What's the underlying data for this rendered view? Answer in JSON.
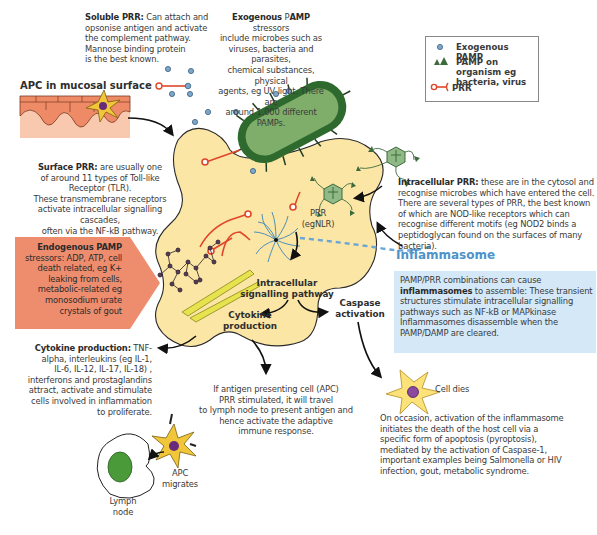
{
  "legend": {
    "items": [
      {
        "icon": "blue-circle-icon",
        "label": "Exogenous PAMP"
      },
      {
        "icon": "green-triangles-icon",
        "label": "PAMP on organism eg bacteria, virus"
      },
      {
        "icon": "red-receptor-icon",
        "label": "PRR"
      }
    ]
  },
  "labels": {
    "apc_mucosal": "APC in mucosal surface",
    "prr_egnlr_1": "PRR",
    "prr_egnlr_2": "(egNLR)",
    "intracellular_pathway_1": "Intracellular",
    "intracellular_pathway_2": "signalling pathway",
    "caspase_1": "Caspase",
    "caspase_2": "activation",
    "cytokine_1": "Cytokine",
    "cytokine_2": "production",
    "inflammasome_title": "Inflammasome",
    "cell_dies": "Cell dies",
    "apc_migrates_1": "APC",
    "apc_migrates_2": "migrates",
    "lymph_node_1": "Lymph",
    "lymph_node_2": "node"
  },
  "text_blocks": {
    "soluble_prr": {
      "bold": "Soluble PRR:",
      "lines": [
        " Can attach and",
        "opsonise antigen and activate",
        "the complement pathway.",
        "Mannose binding protein",
        "is the best known."
      ]
    },
    "exogenous_pamp": {
      "bold": "Exogenous",
      "mid": " P",
      "bold2": "AMP",
      "lines": [
        " stressors",
        "include microbes such as",
        "viruses, bacteria and parasites,",
        "chemical substances, physical",
        "agents, eg UV light. There are",
        "around 1,000 different PAMPs."
      ]
    },
    "surface_prr": {
      "bold": "Surface PRR:",
      "lines": [
        " are usually one",
        "of around 11 types of Toll-like",
        "Receptor (TLR).",
        "These transmembrane receptors",
        "activate intracellular signalling cascades,",
        "often via the NF-kB pathway."
      ]
    },
    "intracellular_prr": {
      "bold": "Intracellular PRR:",
      "lines": [
        " these are in the cytosol and",
        "recognise microbes which have entered the cell.",
        "There are several types of PRR, the best known",
        "of which are NOD-like receptors which can",
        "recognise different motifs (eg NOD2 binds a",
        "peptidoglycan found on the surfaces of many",
        "bacteria)."
      ]
    },
    "endogenous_pamp": {
      "bold": "Endogenous PAMP",
      "lines": [
        "stressors: ADP, ATP, cell",
        "death related, eg K+",
        "leaking from cells,",
        "metabolic-related eg",
        "monosodium urate",
        "crystals of gout"
      ]
    },
    "inflammasome_box": {
      "line1": "PAMP/PRR combinations can cause",
      "bold": "inflammasomes",
      "lines": [
        " to assemble: These transient",
        "structures  stimulate intracellular signalling",
        "pathways such as NF-kB or MAPkinase",
        "Inflammasomes disassemble when the",
        "PAMP/DAMP are cleared."
      ]
    },
    "cytokine_production": {
      "bold": "Cytokine production:",
      "lines": [
        " TNF-",
        "alpha, interleukins (eg IL-1,",
        "IL-6, IL-12, IL-17, IL-18) ,",
        "interferons and prostaglandins",
        "attract, activate and stimulate",
        "cells involved in inflammation",
        "to proliferate."
      ]
    },
    "apc_lymph": {
      "lines": [
        "If antigen presenting cell (APC)",
        "PRR stimulated, it will travel",
        "to lymph node to present antigen and",
        "hence activate the adaptive",
        "immune response."
      ]
    },
    "pyroptosis": {
      "lines": [
        "On occasion, activation of the inflammasome",
        "initiates the death of the host cell via a",
        "specific form of apoptosis (pyroptosis),",
        "mediated by the activation of Caspase-1,",
        "important examples being Salmonella or HIV",
        "infection, gout, metabolic syndrome."
      ]
    }
  },
  "colors": {
    "cell_fill": "#fbe6a6",
    "prr_red": "#e0462a",
    "pamp_blue": "#7da7c9",
    "bacteria_dark": "#2e6a2e",
    "bacteria_light": "#7fae6a",
    "endogenous_box": "#ee8d6e",
    "inflammasome_blue": "#4d93c9",
    "inflammasome_box": "#d4e8f8",
    "mucosa": "#f0a07a"
  }
}
